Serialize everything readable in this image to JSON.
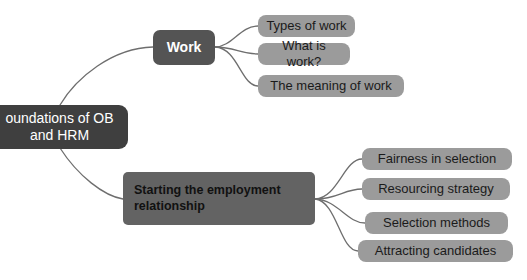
{
  "diagram": {
    "type": "mind-map",
    "colors": {
      "background": "#ffffff",
      "root_fill": "#3f3f3f",
      "root_text": "#ffffff",
      "branch_dark_fill": "#545454",
      "branch_dark_text": "#ffffff",
      "branch_mid_fill": "#636363",
      "branch_mid_text": "#111111",
      "leaf_fill": "#9b9b9b",
      "leaf_text": "#1a1a1a",
      "edge_stroke": "#6e6e6e"
    },
    "root": {
      "label": "Foundations of OB and HRM",
      "line1": "oundations of OB",
      "line2": "and HRM"
    },
    "branches": [
      {
        "id": "work",
        "label": "Work",
        "children": [
          {
            "id": "types-of-work",
            "label": "Types of work"
          },
          {
            "id": "what-is-work",
            "label": "What is work?"
          },
          {
            "id": "the-meaning-of-work",
            "label": "The meaning of work"
          }
        ]
      },
      {
        "id": "starting-the-employment-relationship",
        "label": "Starting the employment relationship",
        "line1": "Starting the employment",
        "line2": "relationship",
        "children": [
          {
            "id": "fairness-in-selection",
            "label": "Fairness in selection"
          },
          {
            "id": "resourcing-strategy",
            "label": "Resourcing strategy"
          },
          {
            "id": "selection-methods",
            "label": "Selection methods"
          },
          {
            "id": "attracting-candidates",
            "label": "Attracting candidates"
          }
        ]
      }
    ]
  }
}
